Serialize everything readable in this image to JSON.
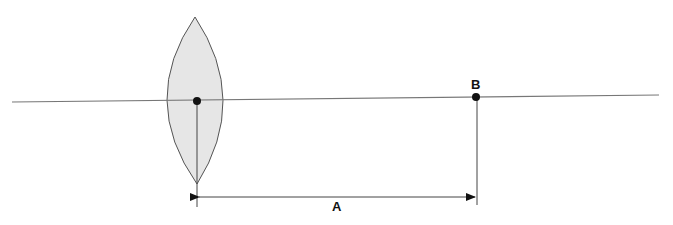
{
  "diagram": {
    "type": "convex-lens-optics",
    "colors": {
      "line": "#777777",
      "lens_fill": "#e6e6e6",
      "lens_stroke": "#555555",
      "point": "#111111",
      "label": "#111111"
    },
    "optical_axis": {
      "x1": 12,
      "y1": 102,
      "x2": 659,
      "y2": 95
    },
    "lens": {
      "center": {
        "x": 197,
        "y": 101
      },
      "top": {
        "x": 195,
        "y": 17
      },
      "bottom": {
        "x": 197,
        "y": 184
      },
      "half_width": 27
    },
    "points": [
      {
        "id": "lens-center",
        "x": 197,
        "y": 101,
        "label": ""
      },
      {
        "id": "B",
        "x": 476,
        "y": 97,
        "label": "B"
      }
    ],
    "labels": {
      "point_b": "B",
      "distance": "A"
    },
    "dimension": {
      "label": "A",
      "x1": 197,
      "x2": 477,
      "y": 197,
      "left_ext": {
        "x": 197,
        "y1": 101,
        "y2": 207
      },
      "right_ext": {
        "x": 477,
        "y1": 97,
        "y2": 205
      }
    }
  }
}
